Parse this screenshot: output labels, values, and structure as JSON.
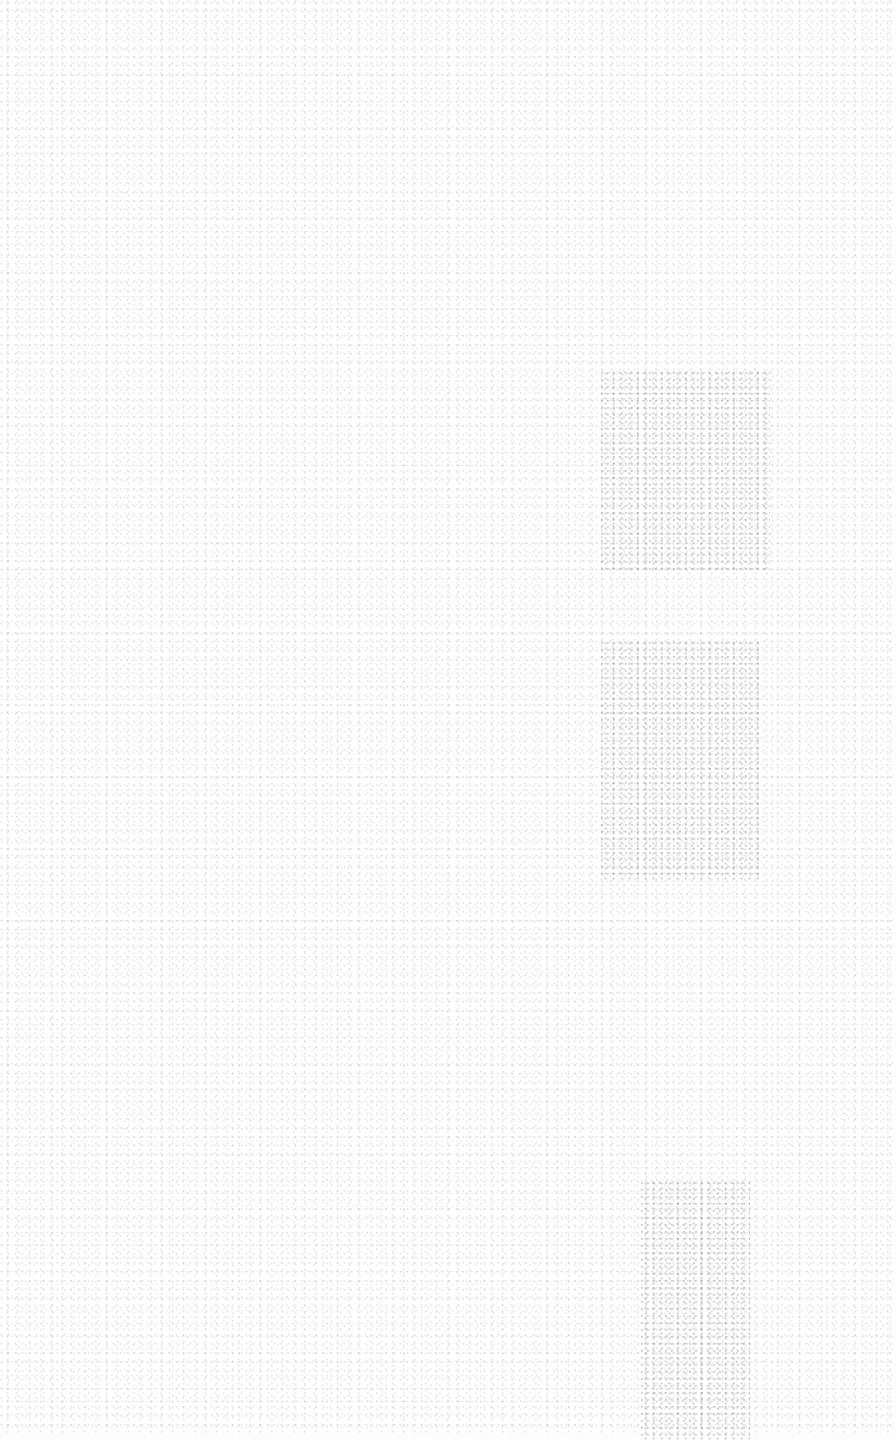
{
  "canvas": {
    "description": "Blank speckled off-white texture, no legible content",
    "background_color": "#fefefe",
    "speckle_color": "#8a8a8a",
    "shaded_regions": [
      {
        "x": 600,
        "y": 370,
        "w": 170,
        "h": 200
      },
      {
        "x": 600,
        "y": 640,
        "w": 160,
        "h": 240
      },
      {
        "x": 640,
        "y": 1180,
        "w": 110,
        "h": 260
      }
    ]
  }
}
